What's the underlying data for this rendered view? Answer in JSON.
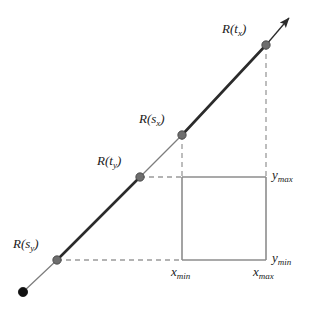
{
  "diagram": {
    "type": "geometry-diagram",
    "canvas": {
      "width": 313,
      "height": 309
    },
    "colors": {
      "background": "#ffffff",
      "ray_thin": "#7d7d7d",
      "ray_thick": "#2b2b2b",
      "marker_gray": "#6e6e6e",
      "marker_black": "#111111",
      "dashed": "#9a9a9a",
      "box_stroke": "#8c8c8c",
      "text": "#1a1a1a"
    },
    "ray": {
      "origin": {
        "x": 23,
        "y": 292
      },
      "arrow_tip": {
        "x": 292,
        "y": 14
      },
      "direction_label": "arrow-head"
    },
    "points": [
      {
        "id": "Rtx",
        "label_base": "R(t",
        "label_sub": "x",
        "label_close": ")",
        "x": 266,
        "y": 45,
        "marker": "gray"
      },
      {
        "id": "Rsx",
        "label_base": "R(s",
        "label_sub": "x",
        "label_close": ")",
        "x": 182,
        "y": 135,
        "marker": "gray"
      },
      {
        "id": "Rty",
        "label_base": "R(t",
        "label_sub": "y",
        "label_close": ")",
        "x": 140,
        "y": 177,
        "marker": "gray"
      },
      {
        "id": "Rsy",
        "label_base": "R(s",
        "label_sub": "y",
        "label_close": ")",
        "x": 57,
        "y": 260,
        "marker": "gray"
      },
      {
        "id": "origin",
        "label_base": "",
        "label_sub": "",
        "label_close": "",
        "x": 23,
        "y": 292,
        "marker": "black"
      }
    ],
    "box": {
      "x_min_px": 182,
      "x_max_px": 266,
      "y_max_px": 177,
      "y_min_px": 260
    },
    "labels": {
      "Rtx": {
        "base": "R(t",
        "sub": "x",
        "close": ")"
      },
      "Rsx": {
        "base": "R(s",
        "sub": "x",
        "close": ")"
      },
      "Rty": {
        "base": "R(t",
        "sub": "y",
        "close": ")"
      },
      "Rsy": {
        "base": "R(s",
        "sub": "y",
        "close": ")"
      },
      "ymax": {
        "base": "y",
        "sub": "max",
        "close": ""
      },
      "ymin": {
        "base": "y",
        "sub": "min",
        "close": ""
      },
      "xmin": {
        "base": "x",
        "sub": "min",
        "close": ""
      },
      "xmax": {
        "base": "x",
        "sub": "max",
        "close": ""
      }
    },
    "segments": [
      {
        "name": "origin-to-Rsy",
        "weight": "thin",
        "from": "origin",
        "to": "Rsy"
      },
      {
        "name": "Rsy-to-Rty",
        "weight": "thick",
        "from": "Rsy",
        "to": "Rty"
      },
      {
        "name": "Rty-to-Rsx",
        "weight": "thin",
        "from": "Rty",
        "to": "Rsx"
      },
      {
        "name": "Rsx-to-Rtx",
        "weight": "thick",
        "from": "Rsx",
        "to": "Rtx"
      },
      {
        "name": "Rtx-to-arrow",
        "weight": "thin",
        "from": "Rtx",
        "to": "arrow_tip"
      }
    ],
    "dashed_guides": [
      {
        "name": "Rsy-horizontal",
        "x1": 57,
        "y1": 260,
        "x2": 182,
        "y2": 260
      },
      {
        "name": "Rty-horizontal",
        "x1": 140,
        "y1": 177,
        "x2": 182,
        "y2": 177
      },
      {
        "name": "Rsx-vertical",
        "x1": 182,
        "y1": 135,
        "x2": 182,
        "y2": 177
      },
      {
        "name": "Rtx-vertical",
        "x1": 266,
        "y1": 45,
        "x2": 266,
        "y2": 177
      }
    ]
  }
}
